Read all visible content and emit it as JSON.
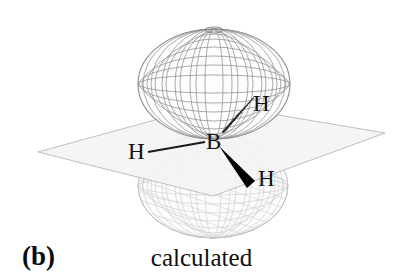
{
  "figure": {
    "panel_letter": "(b)",
    "caption": "calculated",
    "background_color": "#ffffff"
  },
  "molecule": {
    "center_atom": {
      "label": "B",
      "name": "boron"
    },
    "hydrogens": [
      {
        "label": "H",
        "bond_style": "plain-line",
        "position": "left"
      },
      {
        "label": "H",
        "bond_style": "hashed-wedge",
        "position": "upper-right"
      },
      {
        "label": "H",
        "bond_style": "solid-wedge",
        "position": "lower-right"
      }
    ]
  },
  "orbital": {
    "type": "p-orbital",
    "render_style": "wireframe-mesh",
    "lobes": [
      {
        "name": "upper-lobe",
        "shade": "#8e8e8e",
        "shape": "oblate-ellipsoid"
      },
      {
        "name": "lower-lobe",
        "shade": "#c4c4c4",
        "shape": "oblate-ellipsoid"
      }
    ],
    "nodal_plane": {
      "name": "molecular-plane",
      "fill": "#f2f2f2",
      "edge": "#b4b4b4"
    }
  },
  "colors": {
    "label_text": "#111111",
    "bond_dark": "#000000",
    "mesh_dark": "#8e8e8e",
    "mesh_light": "#c6c6c6"
  }
}
